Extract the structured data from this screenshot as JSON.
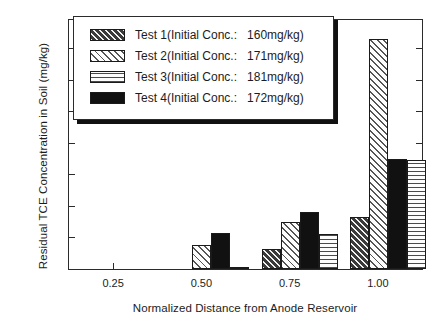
{
  "chart_data": {
    "type": "bar",
    "title": "",
    "xlabel": "Normalized Distance from Anode Reservoir",
    "ylabel": "Residual TCE Concentration in Soil (mg/kg)",
    "categories": [
      "0.25",
      "0.50",
      "0.75",
      "1.00"
    ],
    "xtick_labels": [
      "0.25",
      "0.50",
      "0.75",
      "1.00"
    ],
    "ytick_labels": [
      "0",
      "20",
      "40",
      "60",
      "80",
      "100",
      "120",
      "140"
    ],
    "ylim": [
      0,
      158
    ],
    "ymajor_step": 20,
    "grid": false,
    "legend_position": "upper-left-inside",
    "bar_order": [
      "Test 1",
      "Test 2",
      "Test 4",
      "Test 3"
    ],
    "series": [
      {
        "name": "Test 1",
        "legend_label": "Test 1(Initial Conc.:   160mg/kg)",
        "initial_conc": "160mg/kg",
        "pattern": "dark-diagonal-hatch",
        "values": [
          0,
          0,
          13,
          33
        ]
      },
      {
        "name": "Test 2",
        "legend_label": "Test 2(Initial Conc.:   171mg/kg)",
        "initial_conc": "171mg/kg",
        "pattern": "light-diagonal-hatch",
        "values": [
          0,
          15,
          30,
          146
        ]
      },
      {
        "name": "Test 3",
        "legend_label": "Test 3(Initial Conc.:   181mg/kg)",
        "initial_conc": "181mg/kg",
        "pattern": "horizontal-lines",
        "values": [
          0,
          1,
          22,
          69
        ]
      },
      {
        "name": "Test 4",
        "legend_label": "Test 4(Initial Conc.:   172mg/kg)",
        "initial_conc": "172mg/kg",
        "pattern": "solid-black",
        "values": [
          0,
          23,
          36,
          70
        ]
      }
    ]
  },
  "legend": {
    "rows": [
      {
        "label": "Test 1(Initial Conc.:   160mg/kg)",
        "pattern": "dark-diagonal-hatch"
      },
      {
        "label": "Test 2(Initial Conc.:   171mg/kg)",
        "pattern": "light-diagonal-hatch"
      },
      {
        "label": "Test 3(Initial Conc.:   181mg/kg)",
        "pattern": "horizontal-lines"
      },
      {
        "label": "Test 4(Initial Conc.:   172mg/kg)",
        "pattern": "solid-black"
      }
    ]
  },
  "colors": {
    "axis": "#2b2b2b",
    "text": "#1c1c1c",
    "background": "#ffffff",
    "solid_bar": "#111111"
  }
}
